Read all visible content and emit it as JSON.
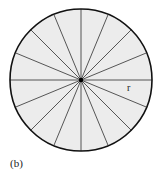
{
  "figure": {
    "caption": "(b)",
    "radius_label": "r",
    "sectors": 16,
    "colors": {
      "fill": "#ececec",
      "stroke": "#111111",
      "spoke": "#444444"
    }
  }
}
